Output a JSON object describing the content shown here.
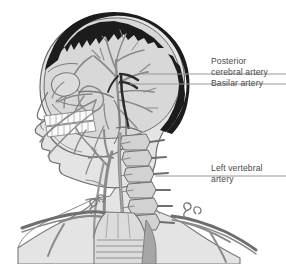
{
  "figure": {
    "background_color": "#ffffff",
    "skin_fill": "#e4e4e4",
    "cranium_fill": "#d6d6d6",
    "hair_color": "#1c1c1c",
    "bone_fill": "#cfcfcf",
    "tooth_fill": "#fdfdfd",
    "artery_color": "#8a8a8a",
    "artery_dark_color": "#2b2b2b",
    "outline_color": "#6e6e6e",
    "leader_line_color": "#9a9a9a",
    "label_text_color": "#4a4a4a"
  },
  "labels": {
    "posterior_cerebral_artery": {
      "line1": "Posterior",
      "line2": "cerebral artery"
    },
    "basilar_artery": {
      "line1": "Basilar artery"
    },
    "left_vertebral_artery": {
      "line1": "Left vertebral",
      "line2": "artery"
    }
  },
  "leader_lines": [
    {
      "name": "posterior-cerebral-leader",
      "x1": 142,
      "y1": 74,
      "x2": 286,
      "y2": 74
    },
    {
      "name": "basilar-leader",
      "x1": 130,
      "y1": 84,
      "x2": 286,
      "y2": 84
    },
    {
      "name": "left-vertebral-leader",
      "x1": 155,
      "y1": 176,
      "x2": 286,
      "y2": 176
    }
  ]
}
